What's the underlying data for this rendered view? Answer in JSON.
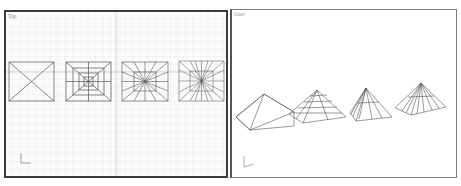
{
  "viewports": [
    {
      "label": "Top",
      "projection": "orthographic-top",
      "grid": true,
      "objects": [
        "pyramid-1-segment",
        "pyramid-concentric-segments",
        "pyramid-radial-segments",
        "pyramid-radial-dense-segments"
      ],
      "axis_gizmo": "xy-axis-icon"
    },
    {
      "label": "User",
      "projection": "perspective-user",
      "grid": false,
      "objects": [
        "pyramid-plain",
        "pyramid-banded",
        "pyramid-fan",
        "pyramid-fan-dense"
      ],
      "axis_gizmo": "xyz-axis-icon"
    }
  ],
  "colors": {
    "grid": "#dcdcdc",
    "grid_major": "#c8c8c8",
    "wire": "#555555",
    "border_active": "#3a3a3a"
  }
}
